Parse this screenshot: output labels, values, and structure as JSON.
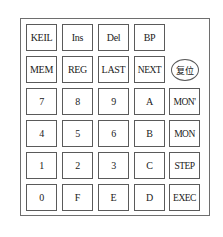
{
  "keypad": {
    "rows": [
      [
        "KEIL",
        "Ins",
        "Del",
        "BP"
      ],
      [
        "MEM",
        "REG",
        "LAST",
        "NEXT"
      ],
      [
        "7",
        "8",
        "9",
        "A",
        "MON'"
      ],
      [
        "4",
        "5",
        "6",
        "B",
        "MON"
      ],
      [
        "1",
        "2",
        "3",
        "C",
        "STEP"
      ],
      [
        "0",
        "F",
        "E",
        "D",
        "EXEC"
      ]
    ],
    "reset_label": "复位"
  }
}
